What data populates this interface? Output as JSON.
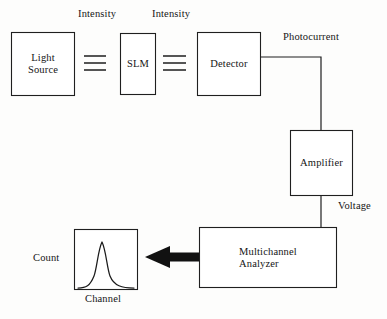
{
  "diagram": {
    "stroke_color": "#1f1f1f",
    "fill_color": "#ffffff",
    "background_color": "#fdfdfc",
    "blocks": [
      {
        "id": "light-source",
        "label": "Light\nSource",
        "x": 11,
        "y": 32,
        "w": 64,
        "h": 64
      },
      {
        "id": "slm",
        "label": "SLM",
        "x": 120,
        "y": 33,
        "w": 36,
        "h": 62
      },
      {
        "id": "detector",
        "label": "Detector",
        "x": 197,
        "y": 32,
        "w": 64,
        "h": 64
      },
      {
        "id": "amplifier",
        "label": "Amplifier",
        "x": 290,
        "y": 130,
        "w": 63,
        "h": 66
      },
      {
        "id": "mca",
        "label": "Multichannel\nAnalyzer",
        "x": 199,
        "y": 227,
        "w": 138,
        "h": 61
      },
      {
        "id": "plot",
        "label": "",
        "x": 74,
        "y": 229,
        "w": 64,
        "h": 61
      }
    ],
    "signal_labels": [
      {
        "id": "intensity-1",
        "text": "Intensity",
        "x": 78,
        "y": 8
      },
      {
        "id": "intensity-2",
        "text": "Intensity",
        "x": 152,
        "y": 8
      },
      {
        "id": "photocurrent",
        "text": "Photocurrent",
        "x": 283,
        "y": 31
      },
      {
        "id": "voltage",
        "text": "Voltage",
        "x": 338,
        "y": 200
      },
      {
        "id": "count",
        "text": "Count",
        "x": 33,
        "y": 252
      },
      {
        "id": "channel",
        "text": "Channel",
        "x": 85,
        "y": 293
      }
    ],
    "beams": [
      {
        "id": "beam-source-to-slm",
        "lines_y": [
          56,
          63,
          70
        ],
        "x1": 84,
        "x2": 106
      },
      {
        "id": "beam-slm-to-detector",
        "lines_y": [
          56,
          63,
          70
        ],
        "x1": 163,
        "x2": 186
      }
    ],
    "wires": [
      {
        "id": "wire-photocurrent",
        "points": "261,57 321,57 321,130"
      },
      {
        "id": "wire-voltage",
        "points": "321,196 321,227"
      }
    ],
    "arrow": {
      "id": "arrow-mca-to-plot",
      "from_x": 199,
      "to_x": 145,
      "y": 257
    },
    "curve": {
      "id": "gaussian-count-curve",
      "type": "gaussian",
      "center_x": 102,
      "peak_y": 242,
      "baseline_y": 288,
      "sigma": 7.5
    }
  }
}
